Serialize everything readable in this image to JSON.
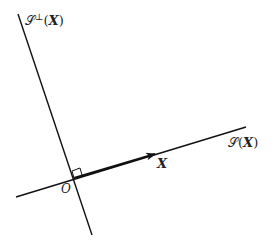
{
  "diagram": {
    "labels": {
      "perp_space_script": "𝒮",
      "perp_space_sup": "⊥",
      "perp_space_arg_open": "(",
      "perp_space_arg": "X",
      "perp_space_arg_close": ")",
      "space_script": "𝒮",
      "space_arg_open": "(",
      "space_arg": "X",
      "space_arg_close": ")",
      "vector": "X",
      "origin": "O"
    },
    "colors": {
      "line": "#111111",
      "text": "#222222"
    }
  }
}
